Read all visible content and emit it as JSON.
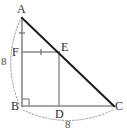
{
  "figure": {
    "background_color": "#ffffff",
    "vertices": [
      {
        "id": "A",
        "label": "A",
        "x": 22,
        "y": 18,
        "label_x": 17,
        "label_y": 3
      },
      {
        "id": "B",
        "label": "B",
        "x": 22,
        "y": 106,
        "label_x": 11,
        "label_y": 100
      },
      {
        "id": "C",
        "label": "C",
        "x": 114,
        "y": 106,
        "label_x": 115,
        "label_y": 100
      },
      {
        "id": "D",
        "label": "D",
        "x": 59,
        "y": 106,
        "label_x": 55,
        "label_y": 108
      },
      {
        "id": "E",
        "label": "E",
        "x": 59,
        "y": 52,
        "label_x": 61,
        "label_y": 41
      },
      {
        "id": "F",
        "label": "F",
        "x": 22,
        "y": 52,
        "label_x": 12,
        "label_y": 46
      }
    ],
    "segments": [
      {
        "name": "hypotenuse-ac",
        "from": "A",
        "to": "C",
        "color": "#1c1c1c",
        "width": 2.0,
        "style": "solid"
      },
      {
        "name": "leg-ab",
        "from": "A",
        "to": "B",
        "color": "#8a8a8a",
        "width": 1.6,
        "style": "solid"
      },
      {
        "name": "leg-bc",
        "from": "B",
        "to": "C",
        "color": "#8a8a8a",
        "width": 1.6,
        "style": "solid"
      },
      {
        "name": "segment-fe",
        "from": "F",
        "to": "E",
        "color": "#8a8a8a",
        "width": 1.4,
        "style": "solid"
      },
      {
        "name": "segment-ed",
        "from": "E",
        "to": "D",
        "color": "#8a8a8a",
        "width": 1.4,
        "style": "solid"
      }
    ],
    "right_angle": {
      "at": "B",
      "size": 7,
      "color": "#6b6b6b"
    },
    "tick_marks": [
      {
        "name": "tick-af",
        "on": "A-F",
        "x": 22,
        "y": 33,
        "orientation": "horizontal",
        "count": 1,
        "color": "#7a7a7a"
      },
      {
        "name": "tick-fe",
        "on": "F-E",
        "x": 41,
        "y": 52,
        "orientation": "vertical",
        "count": 1,
        "color": "#7a7a7a"
      }
    ],
    "measure_arcs": [
      {
        "name": "arc-ab",
        "label": "8",
        "from": "A",
        "to": "B",
        "path": "M 20 20 Q 2 62 19 104",
        "label_x": 1,
        "label_y": 56,
        "color": "#9a9a9a",
        "style": "dashed"
      },
      {
        "name": "arc-bc",
        "label": "8",
        "from": "B",
        "to": "C",
        "path": "M 23 110 Q 68 131 113 110",
        "label_x": 65,
        "label_y": 119,
        "color": "#9a9a9a",
        "style": "dashed"
      }
    ],
    "colors": {
      "stroke_dark": "#1c1c1c",
      "stroke_gray": "#8a8a8a",
      "stroke_dashed": "#9a9a9a",
      "label_text": "#2b2b2b",
      "measure_text": "#4a4a4a"
    }
  }
}
